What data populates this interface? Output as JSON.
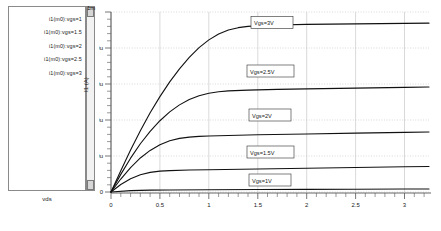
{
  "legend": {
    "items": [
      {
        "label": "i1(m0):vgs=1"
      },
      {
        "label": "i1(m0):vgs=1.5"
      },
      {
        "label": "i1(m0):vgs=2"
      },
      {
        "label": "i1(m0):vgs=2.5"
      },
      {
        "label": "i1(m0):vgs=3"
      }
    ],
    "axis_name": "vds"
  },
  "axis": {
    "y_top_label": "1m",
    "y_title": "I1 (A)",
    "y_ticks": [
      "0",
      "200u",
      "400u",
      "600u",
      "800u"
    ],
    "x_ticks": [
      "0",
      "0.5",
      "1",
      "1.5",
      "2",
      "2.5",
      "3"
    ]
  },
  "annotations": [
    {
      "label": "Vgs=3V"
    },
    {
      "label": "Vgs=2.5V"
    },
    {
      "label": "Vgs=2V"
    },
    {
      "label": "Vgs=1.5V"
    },
    {
      "label": "Vgs=1V"
    }
  ],
  "colors": {
    "curve": "#111111",
    "grid": "#bfbfbf",
    "axis": "#555555",
    "panel_border": "#8a8a8a"
  },
  "chart_data": {
    "type": "line",
    "title": "",
    "xlabel": "vds",
    "ylabel": "I1 (A)",
    "xlim": [
      0,
      3.25
    ],
    "ylim": [
      0,
      0.001
    ],
    "grid": true,
    "legend_position": "left-panel",
    "x_tick_values": [
      0,
      0.5,
      1,
      1.5,
      2,
      2.5,
      3
    ],
    "y_tick_values": [
      0,
      0.0002,
      0.0004,
      0.0006,
      0.0008,
      0.001
    ],
    "y_tick_labels": [
      "0",
      "200u",
      "400u",
      "600u",
      "800u",
      "1m"
    ],
    "series": [
      {
        "name": "i1(m0):vgs=3",
        "annotation": "Vgs=3V",
        "x": [
          0,
          0.1,
          0.2,
          0.3,
          0.4,
          0.5,
          0.6,
          0.7,
          0.8,
          0.9,
          1.0,
          1.1,
          1.2,
          1.3,
          1.4,
          1.5,
          1.7,
          2.0,
          2.5,
          3.0,
          3.25
        ],
        "y": [
          0,
          0.000118,
          0.000233,
          0.00034,
          0.00044,
          0.00053,
          0.000612,
          0.000684,
          0.000748,
          0.000802,
          0.000845,
          0.000878,
          0.0009,
          0.000913,
          0.00092,
          0.000924,
          0.000928,
          0.000931,
          0.000934,
          0.000937,
          0.000938
        ]
      },
      {
        "name": "i1(m0):vgs=2.5",
        "annotation": "Vgs=2.5V",
        "x": [
          0,
          0.1,
          0.2,
          0.3,
          0.4,
          0.5,
          0.6,
          0.7,
          0.8,
          0.9,
          1.0,
          1.1,
          1.2,
          1.4,
          1.7,
          2.0,
          2.5,
          3.0,
          3.25
        ],
        "y": [
          0,
          9.8e-05,
          0.000188,
          0.000268,
          0.000337,
          0.000396,
          0.000445,
          0.000484,
          0.000514,
          0.000535,
          0.000549,
          0.000557,
          0.000562,
          0.000566,
          0.00057,
          0.000573,
          0.000577,
          0.000581,
          0.000583
        ]
      },
      {
        "name": "i1(m0):vgs=2",
        "annotation": "Vgs=2V",
        "x": [
          0,
          0.1,
          0.2,
          0.3,
          0.4,
          0.5,
          0.6,
          0.7,
          0.8,
          0.9,
          1.0,
          1.2,
          1.5,
          2.0,
          2.5,
          3.0,
          3.25
        ],
        "y": [
          0,
          7.2e-05,
          0.000136,
          0.000189,
          0.000231,
          0.000263,
          0.000285,
          0.000298,
          0.000305,
          0.000309,
          0.000311,
          0.000314,
          0.000318,
          0.000322,
          0.000327,
          0.000331,
          0.000333
        ]
      },
      {
        "name": "i1(m0):vgs=1.5",
        "annotation": "Vgs=1.5V",
        "x": [
          0,
          0.1,
          0.2,
          0.3,
          0.4,
          0.5,
          0.6,
          0.8,
          1.0,
          1.5,
          2.0,
          2.5,
          3.0,
          3.25
        ],
        "y": [
          0,
          4.2e-05,
          7.4e-05,
          9.6e-05,
          0.000109,
          0.000116,
          0.000119,
          0.000122,
          0.000124,
          0.000128,
          0.000132,
          0.000136,
          0.00014,
          0.000142
        ]
      },
      {
        "name": "i1(m0):vgs=1",
        "annotation": "Vgs=1V",
        "x": [
          0,
          0.2,
          0.4,
          0.6,
          1.0,
          1.5,
          2.0,
          2.5,
          3.0,
          3.25
        ],
        "y": [
          0,
          7.5e-06,
          1.05e-05,
          1.15e-05,
          1.25e-05,
          1.35e-05,
          1.45e-05,
          1.55e-05,
          1.65e-05,
          1.7e-05
        ]
      }
    ]
  }
}
